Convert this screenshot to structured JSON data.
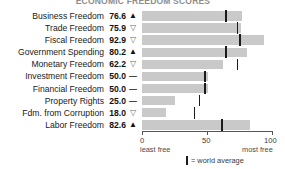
{
  "chart_data": {
    "type": "bar",
    "title": "ECONOMIC FREEDOM SCORES",
    "xlabel": "",
    "ylabel": "",
    "xlim": [
      0,
      100
    ],
    "grid": false,
    "orientation": "horizontal",
    "axis_ticks": [
      0,
      50,
      100
    ],
    "axis_tick_labels": [
      "0",
      "50",
      "100"
    ],
    "axis_end_labels": {
      "left": "least free",
      "right": "most free"
    },
    "legend": {
      "marker": "|",
      "text": "= world average",
      "position": "bottom-center"
    },
    "categories": [
      "Business Freedom",
      "Trade Freedom",
      "Fiscal Freedom",
      "Government Spending",
      "Monetary Freedom",
      "Investment Freedom",
      "Financial Freedom",
      "Property Rights",
      "Fdm. from Corruption",
      "Labor Freedom"
    ],
    "values": [
      76.6,
      75.9,
      92.9,
      80.2,
      62.2,
      50.0,
      50.0,
      25.0,
      18.0,
      82.6
    ],
    "world_average": [
      64.0,
      73.0,
      75.0,
      64.0,
      73.0,
      48.0,
      48.0,
      44.0,
      40.0,
      61.0
    ],
    "trends": [
      "up",
      "down",
      "down",
      "up",
      "down",
      "flat",
      "flat",
      "flat",
      "down",
      "up"
    ],
    "colors": {
      "bar": "#c9c9c9",
      "average_marker": "#1b1b1b",
      "text": "#1a1a1a"
    }
  },
  "rows": [
    {
      "label": "Business Freedom",
      "value": "76.6",
      "trend_glyph": "▲",
      "trend": "up"
    },
    {
      "label": "Trade Freedom",
      "value": "75.9",
      "trend_glyph": "▽",
      "trend": "down"
    },
    {
      "label": "Fiscal Freedom",
      "value": "92.9",
      "trend_glyph": "▽",
      "trend": "down"
    },
    {
      "label": "Government Spending",
      "value": "80.2",
      "trend_glyph": "▲",
      "trend": "up"
    },
    {
      "label": "Monetary Freedom",
      "value": "62.2",
      "trend_glyph": "▽",
      "trend": "down"
    },
    {
      "label": "Investment Freedom",
      "value": "50.0",
      "trend_glyph": "—",
      "trend": "flat"
    },
    {
      "label": "Financial Freedom",
      "value": "50.0",
      "trend_glyph": "—",
      "trend": "flat"
    },
    {
      "label": "Property Rights",
      "value": "25.0",
      "trend_glyph": "—",
      "trend": "flat"
    },
    {
      "label": "Fdm. from Corruption",
      "value": "18.0",
      "trend_glyph": "▽",
      "trend": "down"
    },
    {
      "label": "Labor Freedom",
      "value": "82.6",
      "trend_glyph": "▲",
      "trend": "up"
    }
  ],
  "axis": {
    "tick0": "0",
    "tick50": "50",
    "tick100": "100",
    "least_free": "least free",
    "most_free": "most free"
  },
  "legend": {
    "text": "= world average"
  },
  "title": "ECONOMIC FREEDOM SCORES"
}
